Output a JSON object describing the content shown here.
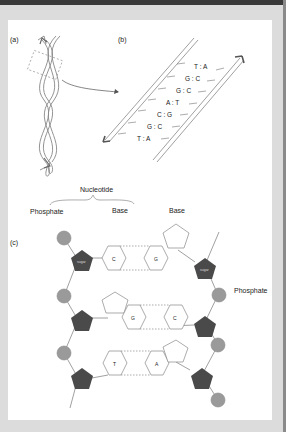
{
  "panels": {
    "a": {
      "label": "(a)"
    },
    "b": {
      "label": "(b)",
      "base_pairs": [
        "T : A",
        "G : C",
        "G : C",
        "A : T",
        "C : G",
        "G : C",
        "T : A"
      ]
    },
    "c": {
      "label": "(c)",
      "labels": {
        "nucleotide": "Nucleotide",
        "phosphate_left": "Phosphate",
        "base_1": "Base",
        "base_2": "Base",
        "phosphate_right": "Phosphate"
      },
      "sugar_label": "sugar",
      "rungs": [
        {
          "left": "C",
          "right": "G"
        },
        {
          "left": "G",
          "right": "C"
        },
        {
          "left": "T",
          "right": "A"
        }
      ]
    }
  },
  "colors": {
    "phosphate": "#9a9a9a",
    "sugar": "#4a4a4a",
    "line": "#777777",
    "background": "#dcdcdc",
    "page": "#ffffff"
  }
}
